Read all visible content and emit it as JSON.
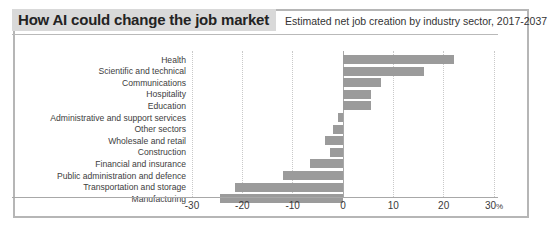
{
  "header": {
    "title": "How AI could change the job market",
    "subtitle": "Estimated net job creation by industry sector, 2017-2037"
  },
  "colors": {
    "bar": "#9b9b9b",
    "title_background": "#d9d9d9",
    "frame_border": "#b6b6b6",
    "gridline": "#c9c9c9",
    "axis": "#a8a8a8",
    "text": "#3b3b3b"
  },
  "axis": {
    "tick_labels": [
      "-30",
      "-20",
      "-10",
      "0",
      "10",
      "20",
      "30%"
    ],
    "unit_suffix": "%"
  },
  "chart_data": {
    "type": "bar",
    "orientation": "horizontal",
    "title": "How AI could change the job market",
    "subtitle": "Estimated net job creation by industry sector, 2017-2037",
    "xlabel": "",
    "ylabel": "",
    "xlim": [
      -30,
      30
    ],
    "xticks": [
      -30,
      -20,
      -10,
      0,
      10,
      20,
      30
    ],
    "xticklabels": [
      "-30",
      "-20",
      "-10",
      "0",
      "10",
      "20",
      "30%"
    ],
    "grid": true,
    "legend": false,
    "categories": [
      "Health",
      "Scientific and technical",
      "Communications",
      "Hospitality",
      "Education",
      "Administrative and support services",
      "Other sectors",
      "Wholesale and retail",
      "Construction",
      "Financial and insurance",
      "Public administration and defence",
      "Transportation and storage",
      "Manufacturing"
    ],
    "values": [
      22,
      16,
      7.5,
      5.5,
      5.5,
      -1,
      -2,
      -3.5,
      -2.5,
      -6.5,
      -12,
      -21.5,
      -24.5
    ]
  }
}
